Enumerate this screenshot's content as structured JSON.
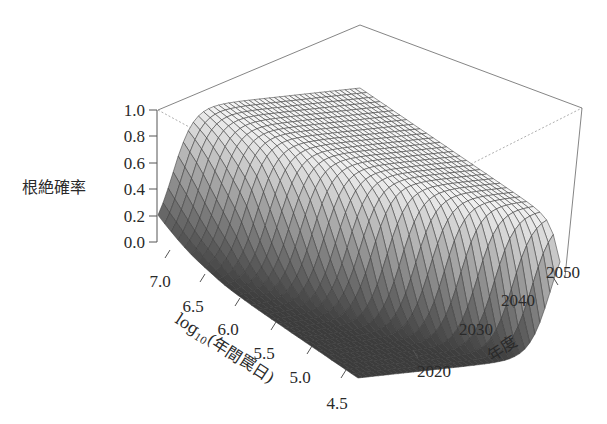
{
  "chart_data": {
    "type": "surface3d",
    "title": "",
    "zlabel": "根絶確率",
    "xlabel": "log10(年間罠日)",
    "xlabel_parts": {
      "base": "log",
      "sub": "10",
      "rest": "(年間罠日)"
    },
    "ylabel": "年度",
    "z_ticks": [
      "0.0",
      "0.2",
      "0.4",
      "0.6",
      "0.8",
      "1.0"
    ],
    "z_range": [
      0,
      1
    ],
    "x_ticks": [
      "7.0",
      "6.5",
      "6.0",
      "5.5",
      "5.0",
      "4.5"
    ],
    "x_range": [
      4.5,
      7.2
    ],
    "y_ticks": [
      "2020",
      "2030",
      "2040",
      "2050"
    ],
    "y_range": [
      2013,
      2055
    ],
    "grid": false,
    "colormap": "grayscale (dark at 0 → light at 1)",
    "surface_description": "Eradication probability rises sigmoidally with year; transition occurs earlier at higher log10 trap-days (≈2016 at 7.0) and later at lower effort (≈2050 at 4.5). Near 0 for low effort / early years, plateau at 1.0 elsewhere.",
    "transition_year_by_effort": [
      {
        "log10_trap_days": 7.2,
        "year_at_p50": 2016
      },
      {
        "log10_trap_days": 7.0,
        "year_at_p50": 2017
      },
      {
        "log10_trap_days": 6.5,
        "year_at_p50": 2020
      },
      {
        "log10_trap_days": 6.0,
        "year_at_p50": 2025
      },
      {
        "log10_trap_days": 5.5,
        "year_at_p50": 2031
      },
      {
        "log10_trap_days": 5.0,
        "year_at_p50": 2040
      },
      {
        "log10_trap_days": 4.75,
        "year_at_p50": 2046
      },
      {
        "log10_trap_days": 4.5,
        "year_at_p50": 2053
      }
    ]
  },
  "labels": {
    "z_title": "根絶確率",
    "x_title_base": "log",
    "x_title_sub": "10",
    "x_title_rest": "(年間罠日)",
    "y_title": "年度",
    "z0": "0.0",
    "z1": "0.2",
    "z2": "0.4",
    "z3": "0.6",
    "z4": "0.8",
    "z5": "1.0",
    "x0": "7.0",
    "x1": "6.5",
    "x2": "6.0",
    "x3": "5.5",
    "x4": "5.0",
    "x5": "4.5",
    "y0": "2020",
    "y1": "2030",
    "y2": "2040",
    "y3": "2050"
  }
}
